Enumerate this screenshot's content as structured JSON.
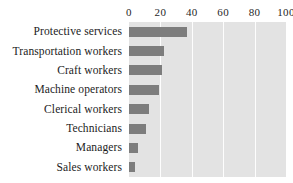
{
  "chart_data": {
    "type": "bar",
    "orientation": "horizontal",
    "title": "",
    "subtitle": "",
    "xlabel": "",
    "ylabel": "",
    "categories": [
      "Protective services",
      "Transportation workers",
      "Craft workers",
      "Machine operators",
      "Clerical workers",
      "Technicians",
      "Managers",
      "Sales workers"
    ],
    "values": [
      37,
      22,
      21,
      19,
      13,
      11,
      6,
      4
    ],
    "xlim": [
      0,
      100
    ],
    "xticks": [
      0,
      20,
      40,
      60,
      80,
      100
    ],
    "xtick_labels": [
      "0",
      "20",
      "40",
      "60",
      "80",
      "100"
    ],
    "grid": true,
    "grid_axis": "x",
    "legend": false,
    "legend_position": "none",
    "colors": {
      "bar": "#7d7d7d",
      "plot_background": "#e3e3e3",
      "gridline": "#fdfdfd",
      "text": "#1c1c1c",
      "page_background": "#ffffff"
    }
  }
}
